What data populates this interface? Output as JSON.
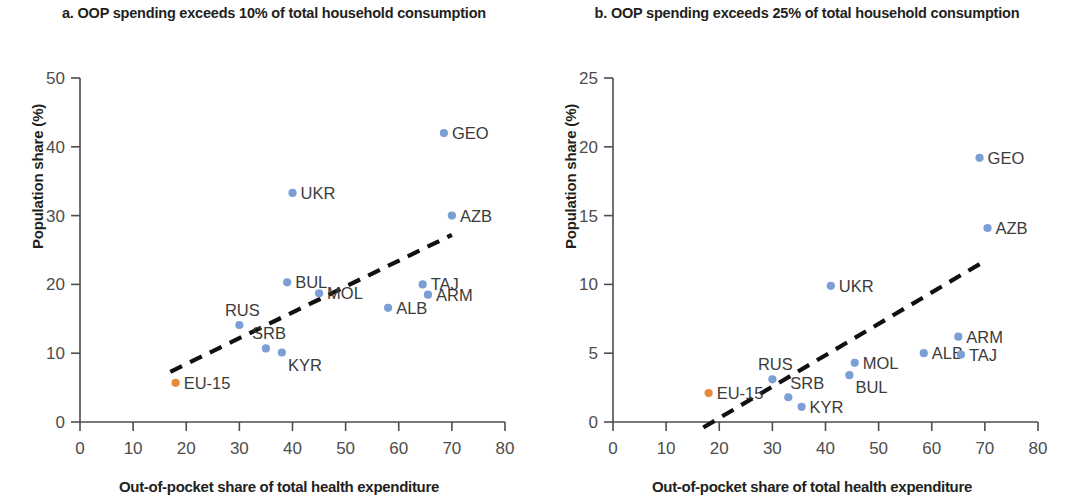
{
  "figure": {
    "axis_color": "#4d4d4d",
    "point_color": "#7b9fd4",
    "highlight_color": "#e8883a",
    "trend_color": "#111111"
  },
  "panel_a": {
    "title": "a. OOP spending exceeds 10% of total household consumption",
    "xlabel": "Out-of-pocket share of total health expenditure",
    "ylabel": "Population share (%)"
  },
  "panel_b": {
    "title": "b. OOP spending exceeds 25% of total household consumption",
    "xlabel": "Out-of-pocket share of total health expenditure",
    "ylabel": "Population share (%)"
  },
  "chart_data": [
    {
      "type": "scatter",
      "panel": "a",
      "title": "a. OOP spending exceeds 10% of total household consumption",
      "xlabel": "Out-of-pocket share of total health expenditure",
      "ylabel": "Population share (%)",
      "xlim": [
        0,
        80
      ],
      "ylim": [
        0,
        50
      ],
      "xticks": [
        0,
        10,
        20,
        30,
        40,
        50,
        60,
        70,
        80
      ],
      "yticks": [
        0,
        10,
        20,
        30,
        40,
        50
      ],
      "grid": false,
      "legend": "none",
      "trendline": {
        "x": [
          17,
          70
        ],
        "y": [
          7.3,
          27.2
        ],
        "style": "dashed"
      },
      "points": [
        {
          "label": "EU-15",
          "x": 18.0,
          "y": 5.7,
          "color": "highlight",
          "label_pos": "right"
        },
        {
          "label": "RUS",
          "x": 30.0,
          "y": 14.1,
          "color": "point",
          "label_pos": "above-left"
        },
        {
          "label": "SRB",
          "x": 35.0,
          "y": 10.7,
          "color": "point",
          "label_pos": "above-left"
        },
        {
          "label": "KYR",
          "x": 38.0,
          "y": 10.1,
          "color": "point",
          "label_pos": "below-right"
        },
        {
          "label": "UKR",
          "x": 40.0,
          "y": 33.3,
          "color": "point",
          "label_pos": "right"
        },
        {
          "label": "BUL",
          "x": 39.0,
          "y": 20.3,
          "color": "point",
          "label_pos": "right"
        },
        {
          "label": "MOL",
          "x": 45.0,
          "y": 18.7,
          "color": "point",
          "label_pos": "right"
        },
        {
          "label": "ALB",
          "x": 58.0,
          "y": 16.6,
          "color": "point",
          "label_pos": "right"
        },
        {
          "label": "TAJ",
          "x": 64.5,
          "y": 20.0,
          "color": "point",
          "label_pos": "right"
        },
        {
          "label": "ARM",
          "x": 65.5,
          "y": 18.5,
          "color": "point",
          "label_pos": "right"
        },
        {
          "label": "AZB",
          "x": 70.0,
          "y": 30.0,
          "color": "point",
          "label_pos": "right"
        },
        {
          "label": "GEO",
          "x": 68.5,
          "y": 42.0,
          "color": "point",
          "label_pos": "right"
        }
      ]
    },
    {
      "type": "scatter",
      "panel": "b",
      "title": "b. OOP spending exceeds 25% of total household consumption",
      "xlabel": "Out-of-pocket share of total health expenditure",
      "ylabel": "Population share (%)",
      "xlim": [
        0,
        80
      ],
      "ylim": [
        0,
        25
      ],
      "xticks": [
        0,
        10,
        20,
        30,
        40,
        50,
        60,
        70,
        80
      ],
      "yticks": [
        0,
        5,
        10,
        15,
        20,
        25
      ],
      "grid": false,
      "legend": "none",
      "trendline": {
        "x": [
          17,
          70
        ],
        "y": [
          -0.4,
          11.7
        ],
        "style": "dashed"
      },
      "points": [
        {
          "label": "EU-15",
          "x": 18.0,
          "y": 2.1,
          "color": "highlight",
          "label_pos": "right"
        },
        {
          "label": "RUS",
          "x": 30.0,
          "y": 3.1,
          "color": "point",
          "label_pos": "above-left"
        },
        {
          "label": "SRB",
          "x": 33.0,
          "y": 1.8,
          "color": "point",
          "label_pos": "above-right"
        },
        {
          "label": "KYR",
          "x": 35.5,
          "y": 1.1,
          "color": "point",
          "label_pos": "right"
        },
        {
          "label": "BUL",
          "x": 44.5,
          "y": 3.4,
          "color": "point",
          "label_pos": "below-right"
        },
        {
          "label": "MOL",
          "x": 45.5,
          "y": 4.3,
          "color": "point",
          "label_pos": "right"
        },
        {
          "label": "UKR",
          "x": 41.0,
          "y": 9.9,
          "color": "point",
          "label_pos": "right"
        },
        {
          "label": "ALB",
          "x": 58.5,
          "y": 5.0,
          "color": "point",
          "label_pos": "right"
        },
        {
          "label": "ARM",
          "x": 65.0,
          "y": 6.2,
          "color": "point",
          "label_pos": "right"
        },
        {
          "label": "TAJ",
          "x": 65.5,
          "y": 4.9,
          "color": "point",
          "label_pos": "right"
        },
        {
          "label": "AZB",
          "x": 70.5,
          "y": 14.1,
          "color": "point",
          "label_pos": "right"
        },
        {
          "label": "GEO",
          "x": 69.0,
          "y": 19.2,
          "color": "point",
          "label_pos": "right"
        }
      ]
    }
  ]
}
